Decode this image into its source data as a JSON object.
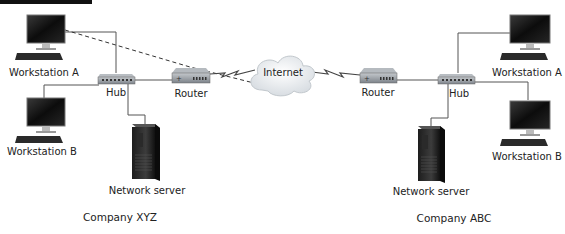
{
  "diagram": {
    "type": "network-topology",
    "cloud": {
      "label": "Internet"
    },
    "companies": [
      {
        "name": "Company XYZ",
        "workstation_a": "Workstation A",
        "workstation_b": "Workstation B",
        "hub": "Hub",
        "router": "Router",
        "server": "Network server"
      },
      {
        "name": "Company ABC",
        "workstation_a": "Workstation A",
        "workstation_b": "Workstation B",
        "hub": "Hub",
        "router": "Router",
        "server": "Network server"
      }
    ],
    "connections": [
      "Workstation A (XYZ) - Hub (XYZ)",
      "Workstation B (XYZ) - Hub (XYZ)",
      "Network server (XYZ) - Hub (XYZ)",
      "Hub (XYZ) - Router (XYZ)",
      "Router (XYZ) - Internet (wireless/WAN link)",
      "Internet - Router (ABC) (wireless/WAN link)",
      "Router (ABC) - Hub (ABC)",
      "Hub (ABC) - Workstation A (ABC)",
      "Hub (ABC) - Workstation B (ABC)",
      "Hub (ABC) - Network server (ABC)",
      "Dashed path: Workstation A (XYZ) -> Router (XYZ) -> Internet"
    ],
    "colors": {
      "line": "#555555",
      "dashed": "#333333",
      "device_dark": "#1a1a1a",
      "device_body": "#8e949b",
      "cloud": "#e9edf0"
    }
  }
}
